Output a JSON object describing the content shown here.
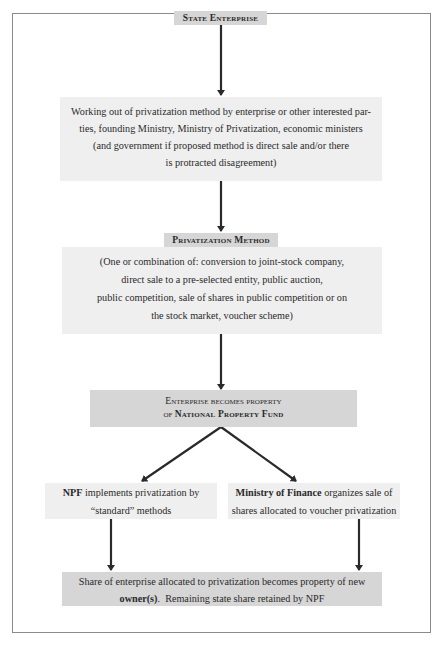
{
  "diagram": {
    "type": "flowchart",
    "colors": {
      "border": "#8a8a8a",
      "box_light": "#efefef",
      "box_dark": "#d6d6d6",
      "arrow": "#2a2a2a"
    },
    "nodes": {
      "state_enterprise": {
        "label": "State Enterprise"
      },
      "working_out": {
        "lines": [
          "Working out of privatization method by enterprise or other interested par-",
          "ties, founding Ministry, Ministry of Privatization, economic ministers",
          "(and government if proposed method is direct sale and/or there",
          "is protracted disagreement)"
        ]
      },
      "privatization_method": {
        "label": "Privatization Method",
        "lines": [
          "(One or combination of: conversion to joint-stock company,",
          "direct sale to a pre-selected entity, public auction,",
          "public competition, sale of shares in public competition or on",
          "the stock market, voucher scheme)"
        ]
      },
      "npf_property": {
        "line1": "Enterprise becomes property",
        "line2_prefix": "of",
        "line2_bold": "National Property Fund"
      },
      "npf_standard": {
        "bold": "NPF",
        "rest1": " implements privatization by",
        "line2": "“standard” methods"
      },
      "ministry_finance": {
        "bold": "Ministry of Finance",
        "rest1": " organizes sale of",
        "line2": "shares allocated to voucher privatization"
      },
      "final": {
        "line1": "Share of enterprise allocated to privatization becomes property of new",
        "bold": "owner(s)",
        "rest2": ".  Remaining state share retained by NPF"
      }
    },
    "edges": [
      {
        "from": "state_enterprise",
        "to": "working_out"
      },
      {
        "from": "working_out",
        "to": "privatization_method"
      },
      {
        "from": "privatization_method",
        "to": "npf_property"
      },
      {
        "from": "npf_property",
        "to": "npf_standard"
      },
      {
        "from": "npf_property",
        "to": "ministry_finance"
      },
      {
        "from": "npf_standard",
        "to": "final"
      },
      {
        "from": "ministry_finance",
        "to": "final"
      }
    ]
  }
}
